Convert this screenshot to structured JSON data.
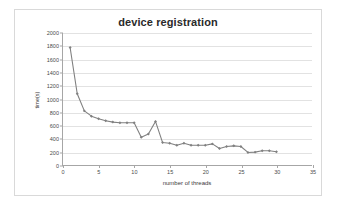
{
  "chart_data": {
    "type": "line",
    "title": "device registration",
    "xlabel": "number of threads",
    "ylabel": "time(s)",
    "xlim": [
      0,
      35
    ],
    "ylim": [
      0,
      2000
    ],
    "xticks": [
      0,
      5,
      10,
      15,
      20,
      25,
      30,
      35
    ],
    "yticks": [
      0,
      200,
      400,
      600,
      800,
      1000,
      1200,
      1400,
      1600,
      1800,
      2000
    ],
    "grid": "horizontal",
    "legend": "none",
    "marker": "diamond",
    "series_color": "#808080",
    "x": [
      1,
      2,
      3,
      4,
      5,
      6,
      7,
      8,
      9,
      10,
      11,
      12,
      13,
      14,
      15,
      16,
      17,
      18,
      19,
      20,
      21,
      22,
      23,
      24,
      25,
      26,
      27,
      28,
      29,
      30
    ],
    "values": [
      1780,
      1080,
      820,
      740,
      700,
      670,
      650,
      640,
      640,
      640,
      420,
      470,
      660,
      340,
      330,
      300,
      330,
      300,
      300,
      300,
      320,
      250,
      280,
      290,
      280,
      190,
      195,
      215,
      215,
      200
    ],
    "series": [
      {
        "name": "device registration",
        "values": [
          1780,
          1080,
          820,
          740,
          700,
          670,
          650,
          640,
          640,
          640,
          420,
          470,
          660,
          340,
          330,
          300,
          330,
          300,
          300,
          300,
          320,
          250,
          280,
          290,
          280,
          190,
          195,
          215,
          215,
          200
        ]
      }
    ]
  },
  "frame": {
    "border_color": "#d9d9d9",
    "background": "#ffffff"
  }
}
